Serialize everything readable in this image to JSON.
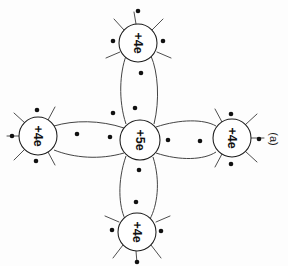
{
  "figure": {
    "panel_label": "(a)",
    "background_color": "#fdfdfd",
    "line_color": "#3a3a3a",
    "dot_color": "#111111",
    "text_rotation_deg": 90,
    "description_type": "covalent-bonding-diagram"
  },
  "atoms": [
    {
      "id": "center",
      "label": "+5e",
      "cx": 140,
      "cy": 140,
      "r": 20,
      "role": "central-donor-atom"
    },
    {
      "id": "top",
      "label": "+4e",
      "cx": 138,
      "cy": 43,
      "r": 19,
      "role": "neighbor-atom"
    },
    {
      "id": "bottom",
      "label": "+4e",
      "cx": 137,
      "cy": 232,
      "r": 19,
      "role": "neighbor-atom"
    },
    {
      "id": "left",
      "label": "+4e",
      "cx": 38,
      "cy": 136,
      "r": 19,
      "role": "neighbor-atom"
    },
    {
      "id": "right",
      "label": "+4e",
      "cx": 232,
      "cy": 138,
      "r": 19,
      "role": "neighbor-atom"
    }
  ],
  "bonds": [
    {
      "id": "bond-top",
      "from": "center",
      "to": "top",
      "electron_count": 2
    },
    {
      "id": "bond-bottom",
      "from": "center",
      "to": "bottom",
      "electron_count": 2
    },
    {
      "id": "bond-left",
      "from": "center",
      "to": "left",
      "electron_count": 2
    },
    {
      "id": "bond-right",
      "from": "center",
      "to": "right",
      "electron_count": 2
    }
  ],
  "electron_dots": [
    {
      "x": 135,
      "y": 108,
      "group": "bond-top"
    },
    {
      "x": 141,
      "y": 73,
      "group": "bond-top"
    },
    {
      "x": 139,
      "y": 170,
      "group": "bond-bottom"
    },
    {
      "x": 136,
      "y": 202,
      "group": "bond-bottom"
    },
    {
      "x": 110,
      "y": 137,
      "group": "bond-left"
    },
    {
      "x": 77,
      "y": 134,
      "group": "bond-left"
    },
    {
      "x": 168,
      "y": 140,
      "group": "bond-right"
    },
    {
      "x": 200,
      "y": 141,
      "group": "bond-right"
    },
    {
      "x": 113,
      "y": 113,
      "group": "free"
    },
    {
      "x": 138,
      "y": 11,
      "group": "top-outer"
    },
    {
      "x": 113,
      "y": 41,
      "group": "top-outer"
    },
    {
      "x": 163,
      "y": 41,
      "group": "top-outer"
    },
    {
      "x": 137,
      "y": 262,
      "group": "bottom-outer"
    },
    {
      "x": 112,
      "y": 230,
      "group": "bottom-outer"
    },
    {
      "x": 161,
      "y": 231,
      "group": "bottom-outer"
    },
    {
      "x": 12,
      "y": 136,
      "group": "left-outer"
    },
    {
      "x": 37,
      "y": 110,
      "group": "left-outer"
    },
    {
      "x": 36,
      "y": 161,
      "group": "left-outer"
    },
    {
      "x": 259,
      "y": 139,
      "group": "right-outer"
    },
    {
      "x": 231,
      "y": 114,
      "group": "right-outer"
    },
    {
      "x": 231,
      "y": 164,
      "group": "right-outer"
    }
  ]
}
